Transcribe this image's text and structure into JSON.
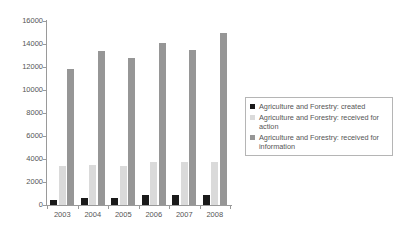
{
  "chart_data": {
    "type": "bar",
    "title": "",
    "xlabel": "",
    "ylabel": "",
    "categories": [
      "2003",
      "2004",
      "2005",
      "2006",
      "2007",
      "2008"
    ],
    "ylim": [
      0,
      16000
    ],
    "ytick_values": [
      0,
      2000,
      4000,
      6000,
      8000,
      10000,
      12000,
      14000,
      16000
    ],
    "ytick_labels": [
      "0",
      "2000",
      "4000",
      "6000",
      "8000",
      "10000",
      "12000",
      "14000",
      "16000"
    ],
    "grid": false,
    "legend_position": "right",
    "series": [
      {
        "name": "Agriculture and Forestry: created",
        "color": "#1a1a1a",
        "values": [
          400,
          650,
          600,
          900,
          900,
          900
        ]
      },
      {
        "name": "Agriculture and Forestry: received for action",
        "color": "#dadada",
        "values": [
          3400,
          3450,
          3350,
          3700,
          3750,
          3700
        ]
      },
      {
        "name": "Agriculture and Forestry: received for information",
        "color": "#969696",
        "values": [
          11800,
          13400,
          12800,
          14100,
          13450,
          15000
        ]
      }
    ]
  },
  "legend": {
    "items": [
      {
        "label": "Agriculture and Forestry: created"
      },
      {
        "label": "Agriculture and Forestry: received for action"
      },
      {
        "label": "Agriculture and Forestry: received for information"
      }
    ]
  }
}
